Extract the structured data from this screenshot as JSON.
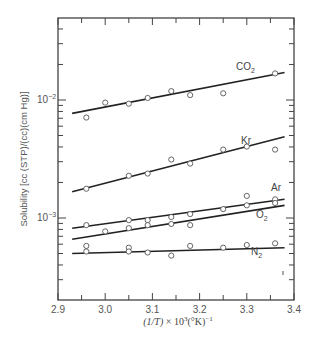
{
  "chart_data": {
    "type": "scatter",
    "title": "",
    "xlabel": "(1/T) × 10³(°K)⁻¹",
    "ylabel": "Solubility [cc (STP)/(cc)(cm Hg)]",
    "xlim": [
      2.9,
      3.4
    ],
    "ylim": [
      0.0002,
      0.05
    ],
    "yscale": "log",
    "grid": false,
    "legend": "inline labels",
    "x_ticks": [
      "2.9",
      "3.0",
      "3.1",
      "3.2",
      "3.3",
      "3.4"
    ],
    "y_ticks": [
      "10⁻³",
      "10⁻²"
    ],
    "series": [
      {
        "name": "CO₂",
        "points": [
          [
            2.96,
            0.0071
          ],
          [
            3.0,
            0.0095
          ],
          [
            3.05,
            0.0093
          ],
          [
            3.09,
            0.0104
          ],
          [
            3.14,
            0.0119
          ],
          [
            3.18,
            0.011
          ],
          [
            3.25,
            0.0114
          ],
          [
            3.36,
            0.0168
          ]
        ],
        "fit": [
          [
            2.93,
            0.0077
          ],
          [
            3.38,
            0.0171
          ]
        ]
      },
      {
        "name": "Kr",
        "points": [
          [
            2.96,
            0.00177
          ],
          [
            3.05,
            0.00228
          ],
          [
            3.09,
            0.00238
          ],
          [
            3.14,
            0.00313
          ],
          [
            3.18,
            0.00289
          ],
          [
            3.25,
            0.0038
          ],
          [
            3.3,
            0.00403
          ],
          [
            3.36,
            0.0038
          ]
        ],
        "fit": [
          [
            2.93,
            0.00167
          ],
          [
            3.38,
            0.00489
          ]
        ]
      },
      {
        "name": "Ar",
        "points": [
          [
            2.96,
            0.00087
          ],
          [
            3.05,
            0.00096
          ],
          [
            3.09,
            0.00096
          ],
          [
            3.14,
            0.00102
          ],
          [
            3.18,
            0.00108
          ],
          [
            3.25,
            0.00119
          ],
          [
            3.3,
            0.00128
          ],
          [
            3.36,
            0.00144
          ]
        ],
        "fit": [
          [
            2.93,
            0.00082
          ],
          [
            3.38,
            0.00144
          ]
        ]
      },
      {
        "name": "O₂",
        "points": [
          [
            3.0,
            0.00077
          ],
          [
            3.05,
            0.00082
          ],
          [
            3.09,
            0.00087
          ],
          [
            3.14,
            0.00089
          ],
          [
            3.18,
            0.00087
          ],
          [
            3.3,
            0.00154
          ],
          [
            3.36,
            0.00134
          ]
        ],
        "fit": [
          [
            2.93,
            0.00066
          ],
          [
            3.38,
            0.00128
          ]
        ]
      },
      {
        "name": "N₂",
        "points": [
          [
            2.96,
            0.00058
          ],
          [
            2.96,
            0.00052
          ],
          [
            3.05,
            0.00056
          ],
          [
            3.05,
            0.00052
          ],
          [
            3.09,
            0.00051
          ],
          [
            3.14,
            0.00048
          ],
          [
            3.18,
            0.00058
          ],
          [
            3.25,
            0.00056
          ],
          [
            3.3,
            0.00059
          ],
          [
            3.36,
            0.00061
          ]
        ],
        "fit": [
          [
            2.93,
            0.0005
          ],
          [
            3.38,
            0.00056
          ]
        ]
      }
    ]
  },
  "labels": {
    "ylabel": "Solubility [cc (STP)/(cc)(cm Hg)]",
    "xlabel": "(1/T) × 10³(°K)⁻¹",
    "x_ticks": [
      "2.9",
      "3.0",
      "3.1",
      "3.2",
      "3.3",
      "3.4"
    ],
    "y_tick_minus2": "10⁻²",
    "y_tick_minus3": "10⁻³",
    "series_co2": "CO₂",
    "series_kr": "Kr",
    "series_ar": "Ar",
    "series_o2": "O₂",
    "series_n2": "N₂"
  }
}
